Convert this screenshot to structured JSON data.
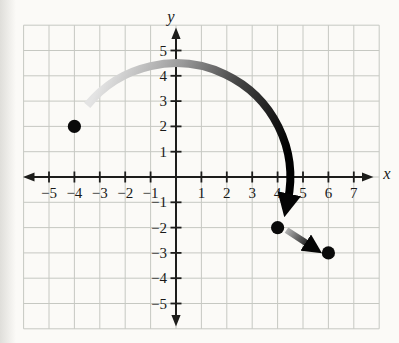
{
  "chart_data": {
    "type": "scatter",
    "title": "",
    "xlabel": "x",
    "ylabel": "y",
    "xlim": [
      -6,
      8
    ],
    "ylim": [
      -6,
      6
    ],
    "grid": true,
    "x_tick_values": [
      -5,
      -4,
      -3,
      -2,
      -1,
      1,
      2,
      3,
      4,
      5,
      6,
      7
    ],
    "x_tick_labels": [
      "−5",
      "−4",
      "−3",
      "−2",
      "−1",
      "1",
      "2",
      "3",
      "4",
      "5",
      "6",
      "7"
    ],
    "y_tick_values": [
      5,
      4,
      3,
      2,
      1,
      -1,
      -2,
      -3,
      -4,
      -5
    ],
    "y_tick_labels": [
      "5",
      "4",
      "3",
      "2",
      "1",
      "−1",
      "−2",
      "−3",
      "−4",
      "−5"
    ],
    "points": [
      {
        "x": -4,
        "y": 2
      },
      {
        "x": 4,
        "y": -2
      },
      {
        "x": 6,
        "y": -3
      }
    ],
    "arrows": {
      "arc": {
        "center": {
          "x": 0,
          "y": 0
        },
        "radius": 4.5,
        "start_angle_deg": 141,
        "end_angle_deg": -12,
        "start_point": {
          "x": -3.5,
          "y": 2.8
        },
        "end_point": {
          "x": 4.2,
          "y": -1.5
        }
      },
      "short": {
        "from": {
          "x": 4.35,
          "y": -2.1
        },
        "to": {
          "x": 5.3,
          "y": -2.72
        }
      }
    },
    "colors": {
      "paper": "#fbfaf7",
      "page_edge": "#dfdeda",
      "grid_line": "#c6c8c2",
      "axis": "#1d1d1b",
      "point": "#0a0a0a",
      "arrow_head": "#050505",
      "arc_gradient": [
        [
          "0",
          "#e4e4e4"
        ],
        [
          "0.33",
          "#9a9a9a"
        ],
        [
          "0.62",
          "#454545"
        ],
        [
          "1",
          "#000000"
        ]
      ],
      "short_gradient": [
        [
          "0",
          "#b0b0b0"
        ],
        [
          "0.75",
          "#1a1a1a"
        ],
        [
          "1",
          "#000000"
        ]
      ]
    }
  }
}
